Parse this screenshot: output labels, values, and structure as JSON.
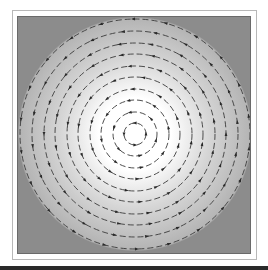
{
  "figure": {
    "center": [
      117,
      117
    ],
    "ring_radii": [
      11,
      22,
      34,
      45,
      57,
      68,
      80,
      91,
      103,
      115
    ],
    "colors": {
      "center_fill": "#ffffff",
      "mid_fill": "#d6d6d6",
      "outer_fill": "#b4b4b4",
      "corner_fill": "#8c8c8c",
      "ring_stroke": "#3a3a3a",
      "marker_fill": "#2a2a2a",
      "frame_border": "#6a6a6a"
    },
    "markers_per_ring": [
      4,
      6,
      8,
      10,
      12,
      14,
      16,
      18,
      20,
      22
    ]
  }
}
